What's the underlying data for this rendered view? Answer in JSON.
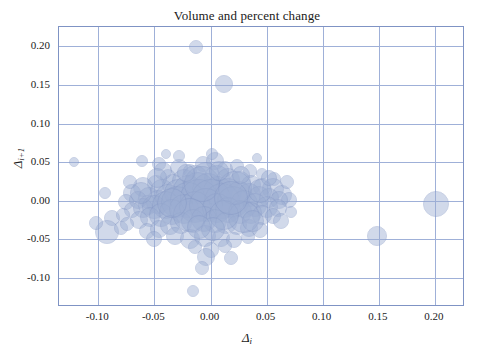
{
  "chart_data": {
    "type": "scatter",
    "title": "Volume and percent change",
    "xlabel": "Δ",
    "xlabel_sub": "i",
    "ylabel": "Δ",
    "ylabel_sub": "i+1",
    "xlim": [
      -0.135,
      0.225
    ],
    "ylim": [
      -0.135,
      0.225
    ],
    "xticks": [
      -0.1,
      -0.05,
      0.0,
      0.05,
      0.1,
      0.15,
      0.2
    ],
    "xticklabels": [
      "-0.10",
      "-0.05",
      "0.00",
      "0.05",
      "0.10",
      "0.15",
      "0.20"
    ],
    "yticks": [
      -0.1,
      -0.05,
      0.0,
      0.05,
      0.1,
      0.15,
      0.2
    ],
    "yticklabels": [
      "-0.10",
      "-0.05",
      "0.00",
      "0.05",
      "0.10",
      "0.15",
      "0.20"
    ],
    "grid": true,
    "grid_color": "#9fb0d8",
    "legend": null,
    "marker_color": "#9badd2",
    "marker_edge_color": "#8699c6",
    "marker_opacity": 0.45,
    "size_encodes": "volume",
    "points": [
      {
        "x": -0.013,
        "y": 0.199,
        "s": 7
      },
      {
        "x": 0.012,
        "y": 0.151,
        "s": 9
      },
      {
        "x": -0.122,
        "y": 0.05,
        "s": 5
      },
      {
        "x": -0.061,
        "y": 0.052,
        "s": 6
      },
      {
        "x": -0.046,
        "y": 0.047,
        "s": 7
      },
      {
        "x": -0.028,
        "y": 0.043,
        "s": 9
      },
      {
        "x": -0.018,
        "y": 0.038,
        "s": 7
      },
      {
        "x": -0.007,
        "y": 0.047,
        "s": 8
      },
      {
        "x": 0.004,
        "y": 0.052,
        "s": 9
      },
      {
        "x": 0.013,
        "y": 0.041,
        "s": 8
      },
      {
        "x": 0.024,
        "y": 0.045,
        "s": 7
      },
      {
        "x": 0.035,
        "y": 0.039,
        "s": 7
      },
      {
        "x": 0.046,
        "y": 0.034,
        "s": 6
      },
      {
        "x": 0.057,
        "y": 0.028,
        "s": 7
      },
      {
        "x": -0.038,
        "y": 0.031,
        "s": 8
      },
      {
        "x": -0.049,
        "y": 0.022,
        "s": 9
      },
      {
        "x": -0.06,
        "y": 0.018,
        "s": 10
      },
      {
        "x": -0.07,
        "y": 0.01,
        "s": 9
      },
      {
        "x": -0.055,
        "y": 0.004,
        "s": 11
      },
      {
        "x": -0.043,
        "y": 0.013,
        "s": 12
      },
      {
        "x": -0.033,
        "y": 0.02,
        "s": 11
      },
      {
        "x": -0.024,
        "y": 0.026,
        "s": 12
      },
      {
        "x": -0.014,
        "y": 0.03,
        "s": 13
      },
      {
        "x": -0.004,
        "y": 0.032,
        "s": 14
      },
      {
        "x": 0.006,
        "y": 0.029,
        "s": 13
      },
      {
        "x": 0.016,
        "y": 0.027,
        "s": 12
      },
      {
        "x": 0.026,
        "y": 0.024,
        "s": 11
      },
      {
        "x": 0.036,
        "y": 0.021,
        "s": 10
      },
      {
        "x": 0.046,
        "y": 0.018,
        "s": 9
      },
      {
        "x": 0.056,
        "y": 0.015,
        "s": 11
      },
      {
        "x": 0.064,
        "y": 0.008,
        "s": 10
      },
      {
        "x": 0.07,
        "y": 0.001,
        "s": 8
      },
      {
        "x": -0.075,
        "y": -0.002,
        "s": 8
      },
      {
        "x": -0.065,
        "y": 0.001,
        "s": 9
      },
      {
        "x": -0.056,
        "y": -0.006,
        "s": 10
      },
      {
        "x": -0.047,
        "y": -0.001,
        "s": 12
      },
      {
        "x": -0.038,
        "y": 0.005,
        "s": 13
      },
      {
        "x": -0.029,
        "y": 0.01,
        "s": 14
      },
      {
        "x": -0.02,
        "y": 0.014,
        "s": 15
      },
      {
        "x": -0.011,
        "y": 0.016,
        "s": 16
      },
      {
        "x": -0.002,
        "y": 0.015,
        "s": 16
      },
      {
        "x": 0.007,
        "y": 0.013,
        "s": 15
      },
      {
        "x": 0.016,
        "y": 0.011,
        "s": 14
      },
      {
        "x": 0.025,
        "y": 0.009,
        "s": 13
      },
      {
        "x": 0.034,
        "y": 0.007,
        "s": 12
      },
      {
        "x": 0.043,
        "y": 0.005,
        "s": 11
      },
      {
        "x": 0.052,
        "y": 0.003,
        "s": 10
      },
      {
        "x": 0.061,
        "y": 0.001,
        "s": 9
      },
      {
        "x": -0.07,
        "y": -0.012,
        "s": 8
      },
      {
        "x": -0.06,
        "y": -0.01,
        "s": 10
      },
      {
        "x": -0.05,
        "y": -0.008,
        "s": 12
      },
      {
        "x": -0.04,
        "y": -0.005,
        "s": 14
      },
      {
        "x": -0.03,
        "y": -0.002,
        "s": 16
      },
      {
        "x": -0.02,
        "y": 0.001,
        "s": 18
      },
      {
        "x": -0.01,
        "y": 0.003,
        "s": 19
      },
      {
        "x": 0.0,
        "y": 0.002,
        "s": 20
      },
      {
        "x": 0.01,
        "y": 0.0,
        "s": 18
      },
      {
        "x": 0.02,
        "y": -0.002,
        "s": 16
      },
      {
        "x": 0.03,
        "y": -0.004,
        "s": 14
      },
      {
        "x": 0.04,
        "y": -0.006,
        "s": 12
      },
      {
        "x": 0.05,
        "y": -0.008,
        "s": 11
      },
      {
        "x": 0.06,
        "y": -0.01,
        "s": 9
      },
      {
        "x": -0.088,
        "y": -0.022,
        "s": 8
      },
      {
        "x": -0.078,
        "y": -0.019,
        "s": 7
      },
      {
        "x": -0.064,
        "y": -0.025,
        "s": 9
      },
      {
        "x": -0.054,
        "y": -0.021,
        "s": 10
      },
      {
        "x": -0.044,
        "y": -0.018,
        "s": 12
      },
      {
        "x": -0.034,
        "y": -0.014,
        "s": 13
      },
      {
        "x": -0.024,
        "y": -0.011,
        "s": 15
      },
      {
        "x": -0.014,
        "y": -0.008,
        "s": 16
      },
      {
        "x": -0.004,
        "y": -0.006,
        "s": 17
      },
      {
        "x": 0.006,
        "y": -0.009,
        "s": 15
      },
      {
        "x": 0.016,
        "y": -0.012,
        "s": 13
      },
      {
        "x": 0.026,
        "y": -0.014,
        "s": 12
      },
      {
        "x": 0.036,
        "y": -0.016,
        "s": 11
      },
      {
        "x": 0.046,
        "y": -0.018,
        "s": 10
      },
      {
        "x": 0.056,
        "y": -0.02,
        "s": 8
      },
      {
        "x": -0.092,
        "y": -0.04,
        "s": 12
      },
      {
        "x": -0.08,
        "y": -0.035,
        "s": 7
      },
      {
        "x": -0.057,
        "y": -0.039,
        "s": 8
      },
      {
        "x": -0.046,
        "y": -0.036,
        "s": 9
      },
      {
        "x": -0.036,
        "y": -0.032,
        "s": 10
      },
      {
        "x": -0.026,
        "y": -0.029,
        "s": 11
      },
      {
        "x": -0.016,
        "y": -0.026,
        "s": 12
      },
      {
        "x": -0.006,
        "y": -0.023,
        "s": 13
      },
      {
        "x": 0.004,
        "y": -0.026,
        "s": 12
      },
      {
        "x": 0.014,
        "y": -0.029,
        "s": 11
      },
      {
        "x": 0.024,
        "y": -0.032,
        "s": 10
      },
      {
        "x": 0.034,
        "y": -0.035,
        "s": 9
      },
      {
        "x": 0.044,
        "y": -0.038,
        "s": 8
      },
      {
        "x": -0.05,
        "y": -0.05,
        "s": 8
      },
      {
        "x": -0.032,
        "y": -0.046,
        "s": 9
      },
      {
        "x": -0.018,
        "y": -0.049,
        "s": 10
      },
      {
        "x": -0.005,
        "y": -0.046,
        "s": 11
      },
      {
        "x": 0.009,
        "y": -0.048,
        "s": 9
      },
      {
        "x": 0.021,
        "y": -0.051,
        "s": 8
      },
      {
        "x": 0.033,
        "y": -0.047,
        "s": 7
      },
      {
        "x": -0.014,
        "y": -0.06,
        "s": 7
      },
      {
        "x": 0.0,
        "y": -0.064,
        "s": 8
      },
      {
        "x": 0.013,
        "y": -0.058,
        "s": 7
      },
      {
        "x": -0.004,
        "y": -0.073,
        "s": 9
      },
      {
        "x": 0.018,
        "y": -0.074,
        "s": 7
      },
      {
        "x": -0.008,
        "y": -0.087,
        "s": 7
      },
      {
        "x": -0.016,
        "y": -0.117,
        "s": 6
      },
      {
        "x": 0.148,
        "y": -0.046,
        "s": 10
      },
      {
        "x": 0.201,
        "y": -0.004,
        "s": 13
      },
      {
        "x": -0.102,
        "y": -0.029,
        "s": 7
      },
      {
        "x": -0.094,
        "y": 0.01,
        "s": 6
      },
      {
        "x": 0.068,
        "y": 0.024,
        "s": 7
      },
      {
        "x": 0.072,
        "y": -0.014,
        "s": 6
      },
      {
        "x": -0.072,
        "y": 0.024,
        "s": 7
      },
      {
        "x": -0.028,
        "y": 0.058,
        "s": 6
      },
      {
        "x": 0.001,
        "y": 0.06,
        "s": 6
      },
      {
        "x": 0.041,
        "y": 0.056,
        "s": 5
      },
      {
        "x": -0.04,
        "y": 0.06,
        "s": 5
      },
      {
        "x": 0.03,
        "y": -0.021,
        "s": 16
      },
      {
        "x": 0.022,
        "y": 0.016,
        "s": 17
      },
      {
        "x": -0.008,
        "y": 0.022,
        "s": 18
      },
      {
        "x": 0.012,
        "y": -0.018,
        "s": 15
      },
      {
        "x": -0.018,
        "y": -0.018,
        "s": 17
      },
      {
        "x": 0.044,
        "y": 0.012,
        "s": 12
      },
      {
        "x": -0.062,
        "y": 0.01,
        "s": 11
      },
      {
        "x": 0.002,
        "y": -0.037,
        "s": 12
      },
      {
        "x": -0.042,
        "y": 0.038,
        "s": 9
      },
      {
        "x": 0.052,
        "y": 0.03,
        "s": 8
      },
      {
        "x": 0.063,
        "y": -0.026,
        "s": 8
      },
      {
        "x": -0.074,
        "y": -0.03,
        "s": 7
      },
      {
        "x": 0.008,
        "y": 0.038,
        "s": 10
      },
      {
        "x": -0.034,
        "y": -0.003,
        "s": 15
      },
      {
        "x": 0.018,
        "y": 0.004,
        "s": 17
      },
      {
        "x": -0.048,
        "y": 0.03,
        "s": 10
      },
      {
        "x": 0.038,
        "y": -0.026,
        "s": 11
      },
      {
        "x": -0.01,
        "y": -0.034,
        "s": 12
      },
      {
        "x": 0.027,
        "y": 0.033,
        "s": 9
      },
      {
        "x": -0.022,
        "y": 0.036,
        "s": 9
      }
    ]
  }
}
